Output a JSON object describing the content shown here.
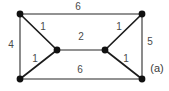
{
  "figure": {
    "caption": "(a)",
    "caption_position": {
      "x": 157,
      "y": 68
    },
    "background_color": "#ffffff",
    "vertex_color": "#111111",
    "edge_color_outer": "#6f6f6f",
    "edge_color_diagonal": "#1c1c1c",
    "label_color": "#4a4a4a"
  },
  "chart_data": {
    "type": "diagram",
    "title": "(a)",
    "nodes": [
      {
        "id": "top-left",
        "x": 20,
        "y": 14
      },
      {
        "id": "top-right",
        "x": 142,
        "y": 14
      },
      {
        "id": "middle-left",
        "x": 57,
        "y": 50
      },
      {
        "id": "middle-right",
        "x": 105,
        "y": 50
      },
      {
        "id": "bottom-left",
        "x": 20,
        "y": 79
      },
      {
        "id": "bottom-right",
        "x": 142,
        "y": 79
      }
    ],
    "edges": [
      {
        "id": "top",
        "from": "top-left",
        "to": "top-right",
        "weight": "6",
        "style": "outer",
        "label_x": 78,
        "label_y": 7
      },
      {
        "id": "left",
        "from": "top-left",
        "to": "bottom-left",
        "weight": "4",
        "style": "outer",
        "label_x": 11,
        "label_y": 45
      },
      {
        "id": "right",
        "from": "top-right",
        "to": "bottom-right",
        "weight": "5",
        "style": "outer",
        "label_x": 150,
        "label_y": 42
      },
      {
        "id": "bottom",
        "from": "bottom-left",
        "to": "bottom-right",
        "weight": "6",
        "style": "outer",
        "label_x": 80,
        "label_y": 70
      },
      {
        "id": "upper-left-diagonal",
        "from": "top-left",
        "to": "middle-left",
        "weight": "1",
        "style": "diagonal",
        "label_x": 43,
        "label_y": 27
      },
      {
        "id": "lower-left-diagonal",
        "from": "bottom-left",
        "to": "middle-left",
        "weight": "1",
        "style": "diagonal",
        "label_x": 35,
        "label_y": 59
      },
      {
        "id": "upper-right-diagonal",
        "from": "top-right",
        "to": "middle-right",
        "weight": "1",
        "style": "diagonal",
        "label_x": 119,
        "label_y": 27
      },
      {
        "id": "lower-right-diagonal",
        "from": "bottom-right",
        "to": "middle-right",
        "weight": "1",
        "style": "diagonal",
        "label_x": 126,
        "label_y": 59
      },
      {
        "id": "middle",
        "from": "middle-left",
        "to": "middle-right",
        "weight": "2",
        "style": "outer",
        "label_x": 81,
        "label_y": 37
      }
    ],
    "node_radius": 3.4
  }
}
